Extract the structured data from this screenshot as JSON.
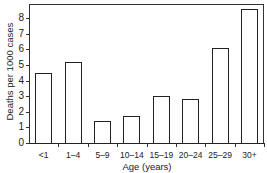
{
  "chart_data": {
    "type": "bar",
    "title": "",
    "xlabel": "Age (years)",
    "ylabel": "Deaths per 1000 cases",
    "categories": [
      "<1",
      "1–4",
      "5–9",
      "10–14",
      "15–19",
      "20–24",
      "25–29",
      "30+"
    ],
    "values": [
      4.5,
      5.2,
      1.4,
      1.7,
      3.0,
      2.8,
      6.1,
      8.6
    ],
    "ylim": [
      0,
      8.9
    ],
    "yticks": [
      0,
      1,
      2,
      3,
      4,
      5,
      6,
      7,
      8
    ],
    "grid": false,
    "legend": null,
    "bar_fill": "#ffffff",
    "bar_edge": "#222222"
  }
}
